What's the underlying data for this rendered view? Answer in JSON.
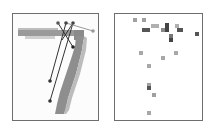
{
  "figure": {
    "left_panel": {
      "title": "",
      "digit": "7",
      "stroke_color": "#8c8c8c",
      "stroke_light_color": "#c8c8c8",
      "edges": [
        {
          "from": [
            50,
            81
          ],
          "to": [
            66,
            23
          ]
        },
        {
          "from": [
            50,
            101
          ],
          "to": [
            73,
            23
          ]
        },
        {
          "from": [
            58,
            23
          ],
          "to": [
            73,
            47
          ]
        },
        {
          "from": [
            73,
            23
          ],
          "to": [
            62,
            40
          ]
        },
        {
          "from": [
            66,
            23
          ],
          "to": [
            93,
            31
          ]
        }
      ],
      "nodes": [
        {
          "x": 58,
          "y": 23,
          "shade": "#555555"
        },
        {
          "x": 66,
          "y": 23,
          "shade": "#444444"
        },
        {
          "x": 73,
          "y": 23,
          "shade": "#444444"
        },
        {
          "x": 93,
          "y": 31,
          "shade": "#999999"
        },
        {
          "x": 73,
          "y": 47,
          "shade": "#222222"
        },
        {
          "x": 50,
          "y": 81,
          "shade": "#333333"
        },
        {
          "x": 50,
          "y": 101,
          "shade": "#333333"
        }
      ]
    },
    "right_panel": {
      "title": "",
      "cells": [
        {
          "x": 133,
          "y": 18,
          "w": 4,
          "h": 4,
          "color": "#a0a0a0"
        },
        {
          "x": 142,
          "y": 18,
          "w": 4,
          "h": 4,
          "color": "#a0a0a0"
        },
        {
          "x": 142,
          "y": 28,
          "w": 8,
          "h": 4,
          "color": "#555555"
        },
        {
          "x": 151,
          "y": 24,
          "w": 8,
          "h": 4,
          "color": "#b0b0b0"
        },
        {
          "x": 161,
          "y": 28,
          "w": 4,
          "h": 4,
          "color": "#888888"
        },
        {
          "x": 165,
          "y": 23,
          "w": 4,
          "h": 9,
          "color": "#444444"
        },
        {
          "x": 175,
          "y": 24,
          "w": 4,
          "h": 4,
          "color": "#b0b0b0"
        },
        {
          "x": 177,
          "y": 28,
          "w": 6,
          "h": 4,
          "color": "#555555"
        },
        {
          "x": 169,
          "y": 34,
          "w": 4,
          "h": 4,
          "color": "#777777"
        },
        {
          "x": 169,
          "y": 38,
          "w": 4,
          "h": 4,
          "color": "#444444"
        },
        {
          "x": 195,
          "y": 32,
          "w": 4,
          "h": 4,
          "color": "#555555"
        },
        {
          "x": 139,
          "y": 51,
          "w": 4,
          "h": 4,
          "color": "#a8a8a8"
        },
        {
          "x": 161,
          "y": 56,
          "w": 4,
          "h": 4,
          "color": "#a8a8a8"
        },
        {
          "x": 174,
          "y": 51,
          "w": 4,
          "h": 4,
          "color": "#a8a8a8"
        },
        {
          "x": 147,
          "y": 64,
          "w": 4,
          "h": 4,
          "color": "#a8a8a8"
        },
        {
          "x": 147,
          "y": 83,
          "w": 4,
          "h": 3,
          "color": "#a0a0a0"
        },
        {
          "x": 147,
          "y": 86,
          "w": 4,
          "h": 4,
          "color": "#555555"
        },
        {
          "x": 152,
          "y": 93,
          "w": 4,
          "h": 4,
          "color": "#a0a0a0"
        },
        {
          "x": 147,
          "y": 111,
          "w": 4,
          "h": 4,
          "color": "#a8a8a8"
        }
      ]
    }
  }
}
